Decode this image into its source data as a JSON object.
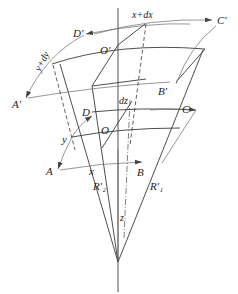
{
  "diagram": {
    "labels": {
      "A_prime": "A′",
      "B_prime": "B′",
      "C_prime": "C′",
      "D_prime": "D′",
      "O_prime": "O′",
      "A": "A",
      "B": "B",
      "C": "C",
      "D": "D",
      "O": "O",
      "x_plus_dx": "x+dx",
      "y_plus_dy": "y+dy",
      "x": "x",
      "y": "y",
      "dz": "dz",
      "z": "z",
      "R1_prime": "R′₁",
      "R2_prime": "R′₂"
    },
    "colors": {
      "line": "#3a3a3a",
      "background": "#ffffff"
    }
  }
}
